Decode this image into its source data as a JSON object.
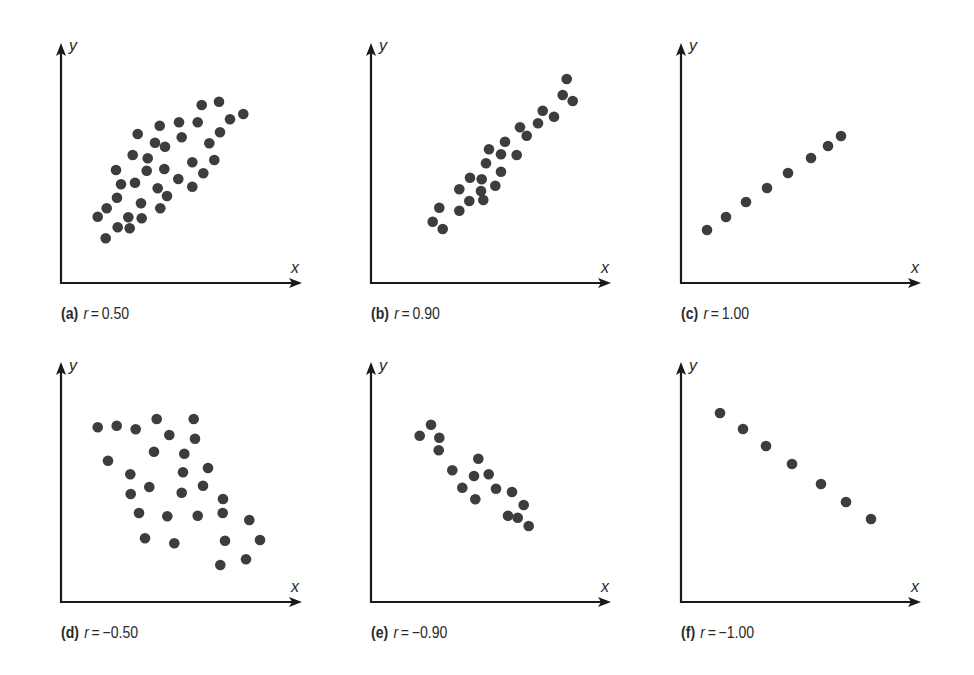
{
  "figure": {
    "dot_color": "#3d3d3d",
    "axis_color": "#1a1a1a"
  },
  "chart_data": [
    {
      "type": "scatter",
      "panel": "a",
      "title": "(a) r = 0.50",
      "letter": "(a)",
      "r_label": "r",
      "r_value": "0.50",
      "xlabel": "x",
      "ylabel": "y",
      "grid": false,
      "axes_px": {
        "origin": [
          61,
          283
        ],
        "y_top": 43,
        "x_end": 302
      },
      "points_px": [
        [
          201.7,
          105
        ],
        [
          219,
          101.7
        ],
        [
          243.3,
          114
        ],
        [
          230,
          119.3
        ],
        [
          179,
          122.3
        ],
        [
          197.7,
          122.3
        ],
        [
          159.7,
          125.7
        ],
        [
          220,
          132.3
        ],
        [
          137.7,
          134
        ],
        [
          181.7,
          137.3
        ],
        [
          155,
          142.7
        ],
        [
          165,
          146.7
        ],
        [
          209.3,
          143.3
        ],
        [
          132.7,
          155
        ],
        [
          147.7,
          158.3
        ],
        [
          214.3,
          160
        ],
        [
          192.3,
          162.3
        ],
        [
          116,
          170
        ],
        [
          146.7,
          170.7
        ],
        [
          164.3,
          169
        ],
        [
          203.3,
          173.3
        ],
        [
          178.3,
          179
        ],
        [
          121,
          184.3
        ],
        [
          135,
          182.7
        ],
        [
          192.3,
          186.7
        ],
        [
          157.7,
          188.3
        ],
        [
          167,
          196
        ],
        [
          117,
          197.7
        ],
        [
          141,
          203.3
        ],
        [
          160.3,
          208.3
        ],
        [
          106.7,
          208.3
        ],
        [
          97.7,
          216.7
        ],
        [
          128.3,
          217.3
        ],
        [
          141.7,
          218.3
        ],
        [
          117.7,
          227.3
        ],
        [
          129.7,
          228.3
        ],
        [
          105.7,
          238.3
        ]
      ]
    },
    {
      "type": "scatter",
      "panel": "b",
      "title": "(b) r = 0.90",
      "letter": "(b)",
      "r_label": "r",
      "r_value": "0.90",
      "xlabel": "x",
      "ylabel": "y",
      "grid": false,
      "axes_px": {
        "origin": [
          371,
          283
        ],
        "y_top": 43,
        "x_end": 611
      },
      "points_px": [
        [
          566.7,
          79
        ],
        [
          562.7,
          95
        ],
        [
          572.7,
          101
        ],
        [
          542.7,
          110.7
        ],
        [
          554,
          116.7
        ],
        [
          538,
          123.3
        ],
        [
          520,
          127.3
        ],
        [
          526.7,
          135.7
        ],
        [
          505,
          141.7
        ],
        [
          489,
          149.3
        ],
        [
          501,
          154.3
        ],
        [
          516.7,
          155
        ],
        [
          486,
          163.3
        ],
        [
          501,
          171.7
        ],
        [
          470,
          177.7
        ],
        [
          481.7,
          179.3
        ],
        [
          459.3,
          189.3
        ],
        [
          495.3,
          185.7
        ],
        [
          481,
          191
        ],
        [
          469.3,
          201
        ],
        [
          483.3,
          200
        ],
        [
          439.3,
          207.7
        ],
        [
          459.3,
          210.7
        ],
        [
          432.7,
          221.7
        ],
        [
          442.7,
          229
        ]
      ]
    },
    {
      "type": "scatter",
      "panel": "c",
      "title": "(c) r = 1.00",
      "letter": "(c)",
      "r_label": "r",
      "r_value": "1.00",
      "xlabel": "x",
      "ylabel": "y",
      "grid": false,
      "axes_px": {
        "origin": [
          681,
          283
        ],
        "y_top": 43,
        "x_end": 921
      },
      "points_px": [
        [
          707,
          230
        ],
        [
          726,
          217
        ],
        [
          746,
          202
        ],
        [
          767,
          188
        ],
        [
          788,
          173
        ],
        [
          811,
          158
        ],
        [
          828,
          146
        ],
        [
          841,
          136
        ]
      ]
    },
    {
      "type": "scatter",
      "panel": "d",
      "title": "(d) r = −0.50",
      "letter": "(d)",
      "r_label": "r",
      "r_value": "−0.50",
      "xlabel": "x",
      "ylabel": "y",
      "grid": false,
      "axes_px": {
        "origin": [
          61,
          602
        ],
        "y_top": 362,
        "x_end": 302
      },
      "points_px": [
        [
          97.7,
          427.3
        ],
        [
          116.7,
          425.7
        ],
        [
          135.7,
          429.3
        ],
        [
          156.7,
          419
        ],
        [
          193.7,
          419
        ],
        [
          169.3,
          435
        ],
        [
          195,
          438.7
        ],
        [
          154,
          451.7
        ],
        [
          184.3,
          453.7
        ],
        [
          108,
          460.7
        ],
        [
          130.3,
          474.3
        ],
        [
          183,
          472.3
        ],
        [
          208,
          468
        ],
        [
          149.3,
          487
        ],
        [
          130.7,
          494
        ],
        [
          181.7,
          492.7
        ],
        [
          203,
          485.7
        ],
        [
          223,
          499
        ],
        [
          139,
          513
        ],
        [
          167.3,
          516.3
        ],
        [
          197.7,
          515.7
        ],
        [
          222.7,
          513
        ],
        [
          249.3,
          520
        ],
        [
          145,
          538.3
        ],
        [
          174.3,
          543.3
        ],
        [
          225,
          540.7
        ],
        [
          260,
          540
        ],
        [
          220.3,
          565
        ],
        [
          246,
          559.3
        ]
      ]
    },
    {
      "type": "scatter",
      "panel": "e",
      "title": "(e) r = −0.90",
      "letter": "(e)",
      "r_label": "r",
      "r_value": "−0.90",
      "xlabel": "x",
      "ylabel": "y",
      "grid": false,
      "axes_px": {
        "origin": [
          371,
          602
        ],
        "y_top": 362,
        "x_end": 611
      },
      "points_px": [
        [
          431,
          424.7
        ],
        [
          419.7,
          435.7
        ],
        [
          439.3,
          437.7
        ],
        [
          438.7,
          450.3
        ],
        [
          478.3,
          458.7
        ],
        [
          452.3,
          470.3
        ],
        [
          474,
          476
        ],
        [
          488.7,
          474.3
        ],
        [
          462.3,
          487.7
        ],
        [
          496,
          488.7
        ],
        [
          512,
          492
        ],
        [
          475.3,
          499.3
        ],
        [
          523.7,
          505
        ],
        [
          508,
          515.7
        ],
        [
          517.7,
          517.7
        ],
        [
          528.7,
          526
        ]
      ]
    },
    {
      "type": "scatter",
      "panel": "f",
      "title": "(f) r = −1.00",
      "letter": "(f)",
      "r_label": "r",
      "r_value": "−1.00",
      "xlabel": "x",
      "ylabel": "y",
      "grid": false,
      "axes_px": {
        "origin": [
          681,
          602
        ],
        "y_top": 362,
        "x_end": 921
      },
      "points_px": [
        [
          720,
          413
        ],
        [
          743,
          429
        ],
        [
          766,
          446
        ],
        [
          792,
          464
        ],
        [
          821,
          484
        ],
        [
          846,
          502
        ],
        [
          871,
          519
        ]
      ]
    }
  ]
}
